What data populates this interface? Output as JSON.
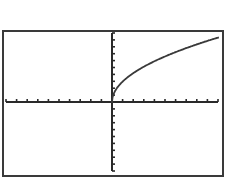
{
  "chart_data": {
    "type": "line",
    "title": "",
    "xlabel": "",
    "ylabel": "",
    "function": "y = a*sqrt(x)",
    "window": {
      "xmin": -10,
      "xmax": 10,
      "xscl": 1,
      "ymin": -10,
      "ymax": 10,
      "yscl": 1
    },
    "grid": false,
    "legend": null,
    "series": [
      {
        "name": "Y1",
        "x": [
          0,
          0.25,
          0.5,
          1,
          1.5,
          2,
          3,
          4,
          5,
          6,
          7,
          8,
          9,
          10
        ],
        "y": [
          0,
          1.48,
          2.09,
          2.95,
          3.61,
          4.17,
          5.11,
          5.9,
          6.6,
          7.23,
          7.8,
          8.34,
          8.85,
          9.33
        ]
      }
    ],
    "colors": {
      "frame": "#3a3a3a",
      "axis": "#2a2a2a",
      "curve": "#3a3a3a",
      "background": "#ffffff"
    }
  }
}
